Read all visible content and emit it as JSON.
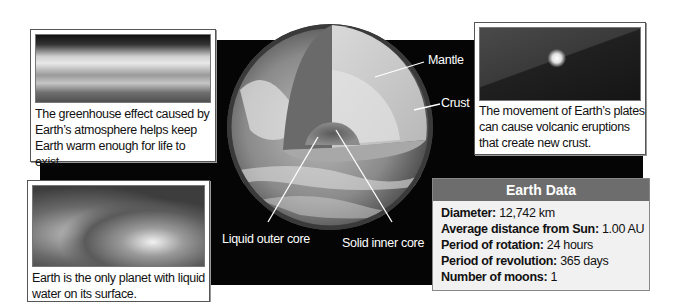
{
  "diagram": {
    "title": "Earth",
    "globe_labels": {
      "mantle": "Mantle",
      "crust": "Crust",
      "liquid_outer_core": "Liquid outer core",
      "solid_inner_core": "Solid inner core"
    },
    "cards": {
      "atmosphere": {
        "image": "atmosphere-photo",
        "caption_lines": [
          "The greenhouse effect caused by",
          "Earth’s atmosphere helps keep",
          "Earth warm enough for life to exist."
        ]
      },
      "ocean": {
        "image": "ocean-wave-photo",
        "caption_lines": [
          "Earth is the only planet with liquid",
          "water on its surface."
        ]
      },
      "volcano": {
        "image": "volcano-photo",
        "caption_lines": [
          "The movement of Earth’s plates",
          "can cause volcanic eruptions",
          "that create new crust."
        ]
      }
    },
    "earth_data": {
      "title": "Earth Data",
      "rows": [
        {
          "label": "Diameter:",
          "value": "12,742 km"
        },
        {
          "label": "Average distance from Sun:",
          "value": "1.00 AU"
        },
        {
          "label": "Period of rotation:",
          "value": "24 hours"
        },
        {
          "label": "Period of revolution:",
          "value": "365 days"
        },
        {
          "label": "Number of moons:",
          "value": "1"
        }
      ]
    },
    "colors": {
      "background": "#050505",
      "data_header": "#6d6d6d",
      "data_body": "#f1f1f1",
      "label_text": "#ffffff"
    }
  }
}
